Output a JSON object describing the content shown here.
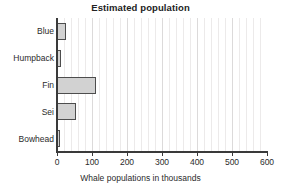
{
  "chart_data": {
    "type": "bar",
    "orientation": "horizontal",
    "title": "Estimated population",
    "xlabel": "Whale populations in thousands",
    "ylabel": "",
    "categories": [
      "Blue",
      "Humpback",
      "Fin",
      "Sei",
      "Bowhead"
    ],
    "values": [
      26,
      10,
      110,
      54,
      8
    ],
    "xlim": [
      0,
      600
    ],
    "xticks": [
      0,
      100,
      200,
      300,
      400,
      500,
      600
    ],
    "xticklabels": [
      "0",
      "100",
      "200",
      "300",
      "400",
      "500",
      "600"
    ],
    "minor_tick_step": 20,
    "grid": "vertical",
    "legend": "none",
    "bar_fill_color": "#d2d2d2",
    "bar_edge_color": "#4d4d4d",
    "background_color": "#ffffff",
    "axis_color": "#3a3a3a"
  }
}
